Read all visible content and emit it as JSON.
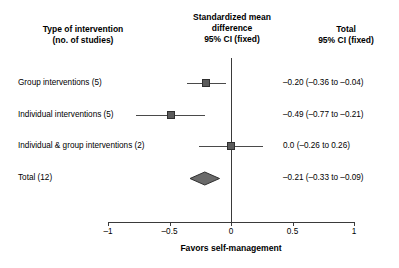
{
  "headers": {
    "column_label": "Type of intervention\n(no. of studies)",
    "column_label_line1": "Type of intervention",
    "column_label_line2": "(no. of studies)",
    "column_effect_line1": "Standardized mean",
    "column_effect_line2": "difference",
    "column_effect_line3": "95% CI (fixed)",
    "column_total_line1": "Total",
    "column_total_line2": "95% CI (fixed)"
  },
  "axis": {
    "title": "Favors self-management",
    "ticks": [
      "–1",
      "–0.5",
      "0",
      "0.5",
      "1"
    ],
    "tick_values": [
      -1,
      -0.5,
      0,
      0.5,
      1
    ],
    "min": -1,
    "max": 1,
    "null_line_value": 0
  },
  "rows": [
    {
      "label": "Group interventions (5)",
      "ci_text": "–0.20 (–0.36 to –0.04)",
      "estimate": -0.2,
      "lower": -0.36,
      "upper": -0.04,
      "studies": 5,
      "type": "study"
    },
    {
      "label": "Individual interventions (5)",
      "ci_text": "–0.49 (–0.77 to –0.21)",
      "estimate": -0.49,
      "lower": -0.77,
      "upper": -0.21,
      "studies": 5,
      "type": "study"
    },
    {
      "label": "Individual & group interventions (2)",
      "ci_text": "0.0 (–0.26 to 0.26)",
      "estimate": 0.0,
      "lower": -0.26,
      "upper": 0.26,
      "studies": 2,
      "type": "study"
    },
    {
      "label": "Total (12)",
      "ci_text": "–0.21 (–0.33 to –0.09)",
      "estimate": -0.21,
      "lower": -0.33,
      "upper": -0.09,
      "studies": 12,
      "type": "summary"
    }
  ],
  "colors": {
    "marker_fill": "#5b5b5b",
    "marker_border": "#2f2f2f",
    "diamond_fill": "#6a6a6a",
    "diamond_border": "#2f2f2f",
    "line": "#3a3a3a",
    "text": "#000000",
    "background": "#ffffff"
  },
  "chart_data": {
    "type": "forest",
    "title": "",
    "xlabel": "Favors self-management",
    "ylabel": "",
    "xlim": [
      -1,
      1
    ],
    "xticks": [
      -1,
      -0.5,
      0,
      0.5,
      1
    ],
    "xticklabels": [
      "–1",
      "–0.5",
      "0",
      "0.5",
      "1"
    ],
    "grid": false,
    "legend": "none",
    "reference_line": 0,
    "effect_measure": "Standardized mean difference 95% CI (fixed)",
    "categories": [
      "Group interventions (5)",
      "Individual interventions (5)",
      "Individual & group interventions (2)",
      "Total (12)"
    ],
    "values": [
      -0.2,
      -0.49,
      0.0,
      -0.21
    ],
    "ci_lower": [
      -0.36,
      -0.77,
      -0.26,
      -0.33
    ],
    "ci_upper": [
      -0.04,
      -0.21,
      0.26,
      -0.09
    ],
    "labels": [
      "–0.20 (–0.36 to –0.04)",
      "–0.49 (–0.77 to –0.21)",
      "0.0 (–0.26 to 0.26)",
      "–0.21 (–0.33 to –0.09)"
    ],
    "marker_types": [
      "square",
      "square",
      "square",
      "diamond"
    ]
  }
}
